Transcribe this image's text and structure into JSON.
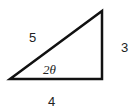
{
  "diagram": {
    "type": "right-triangle",
    "sides": {
      "hypotenuse": "5",
      "opposite": "3",
      "adjacent": "4"
    },
    "angle_label": "2θ",
    "stroke_color": "#111111"
  }
}
